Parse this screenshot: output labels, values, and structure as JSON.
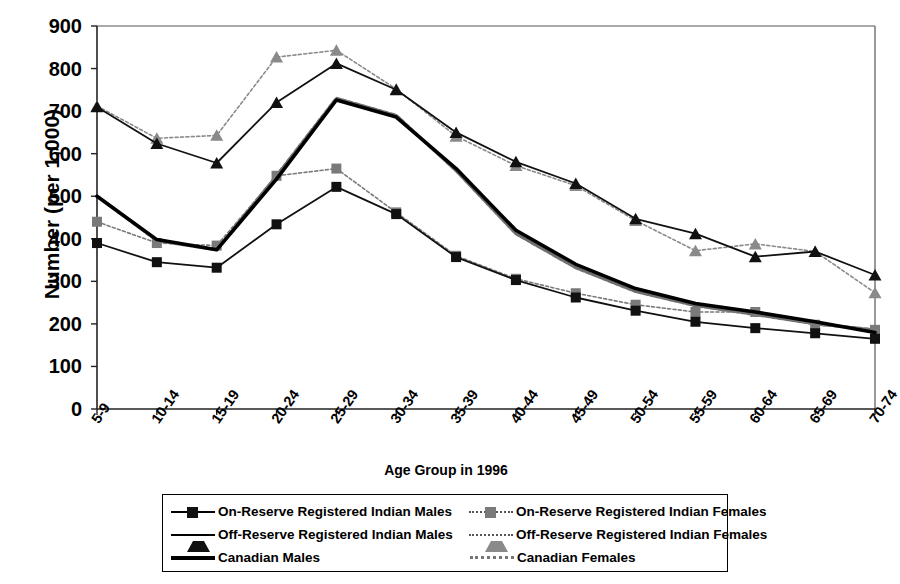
{
  "chart_data": {
    "type": "line",
    "title": "",
    "xlabel": "Age Group in 1996",
    "ylabel": "Number (per 1,000)",
    "ylim": [
      0,
      900
    ],
    "yticks": [
      0,
      100,
      200,
      300,
      400,
      500,
      600,
      700,
      800,
      900
    ],
    "grid": false,
    "legend_position": "bottom",
    "categories": [
      "5-9",
      "10-14",
      "15-19",
      "20-24",
      "25-29",
      "30-34",
      "35-39",
      "40-44",
      "45-49",
      "50-54",
      "55-59",
      "60-64",
      "65-69",
      "70-74"
    ],
    "series": [
      {
        "name": "On-Reserve Registered Indian Males",
        "marker": "square",
        "color": "#111111",
        "line": "solid",
        "values": [
          390,
          345,
          332,
          434,
          522,
          458,
          357,
          303,
          262,
          231,
          205,
          190,
          178,
          165
        ]
      },
      {
        "name": "On-Reserve Registered Indian Females",
        "marker": "square",
        "color": "#7a7a7a",
        "line": "dotted",
        "values": [
          440,
          390,
          384,
          548,
          565,
          462,
          360,
          306,
          272,
          245,
          228,
          228,
          198,
          186
        ]
      },
      {
        "name": "Off-Reserve Registered Indian Males",
        "marker": "triangle",
        "color": "#111111",
        "line": "solid",
        "values": [
          710,
          624,
          578,
          720,
          812,
          750,
          650,
          581,
          530,
          447,
          412,
          358,
          370,
          315
        ]
      },
      {
        "name": "Off-Reserve Registered Indian Females",
        "marker": "triangle",
        "color": "#8a8a8a",
        "line": "dotted",
        "values": [
          712,
          636,
          643,
          827,
          843,
          752,
          641,
          572,
          525,
          443,
          372,
          388,
          370,
          273
        ]
      },
      {
        "name": "Canadian Males",
        "marker": "none",
        "color": "#000000",
        "line": "thick",
        "values": [
          500,
          398,
          374,
          540,
          726,
          686,
          565,
          420,
          340,
          283,
          248,
          228,
          205,
          180
        ]
      },
      {
        "name": "Canadian Females",
        "marker": "none",
        "color": "#6f6f6f",
        "line": "thick-dotted",
        "values": [
          500,
          396,
          374,
          548,
          730,
          690,
          560,
          412,
          332,
          276,
          243,
          222,
          200,
          186
        ]
      }
    ]
  },
  "legend": {
    "rows": [
      {
        "left": "On-Reserve Registered Indian Males",
        "right": "On-Reserve Registered Indian Females"
      },
      {
        "left": "Off-Reserve Registered Indian Males",
        "right": "Off-Reserve Registered Indian Females"
      },
      {
        "left": "Canadian Males",
        "right": "Canadian Females"
      }
    ]
  }
}
